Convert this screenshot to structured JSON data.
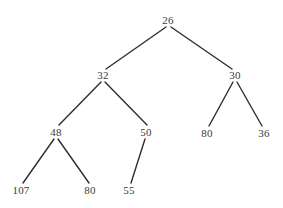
{
  "figure": {
    "kind": "binary-tree-diagram",
    "width": 283,
    "height": 208,
    "background_color": "#ffffff",
    "edge_color": "#2e2e2e",
    "label_color": "#3a3a3a"
  },
  "tree": {
    "root_value": "26",
    "nodes": [
      {
        "id": "n0",
        "label": "26",
        "x": 168,
        "y": 20,
        "level": 0,
        "parent": null
      },
      {
        "id": "n1",
        "label": "32",
        "x": 103,
        "y": 75,
        "level": 1,
        "parent": "n0"
      },
      {
        "id": "n2",
        "label": "30",
        "x": 235,
        "y": 75,
        "level": 1,
        "parent": "n0"
      },
      {
        "id": "n3",
        "label": "48",
        "x": 56,
        "y": 132,
        "level": 2,
        "parent": "n1"
      },
      {
        "id": "n4",
        "label": "50",
        "x": 146,
        "y": 132,
        "level": 2,
        "parent": "n1"
      },
      {
        "id": "n5",
        "label": "80",
        "x": 207,
        "y": 133,
        "level": 2,
        "parent": "n2"
      },
      {
        "id": "n6",
        "label": "36",
        "x": 264,
        "y": 133,
        "level": 2,
        "parent": "n2"
      },
      {
        "id": "n7",
        "label": "107",
        "x": 21,
        "y": 190,
        "level": 3,
        "parent": "n3"
      },
      {
        "id": "n8",
        "label": "80",
        "x": 90,
        "y": 190,
        "level": 3,
        "parent": "n3"
      },
      {
        "id": "n9",
        "label": "55",
        "x": 129,
        "y": 190,
        "level": 3,
        "parent": "n4"
      }
    ],
    "edges": [
      {
        "id": "e0",
        "from": "n0",
        "to": "n1",
        "x1": 166,
        "y1": 27,
        "x2": 106,
        "y2": 69
      },
      {
        "id": "e1",
        "from": "n0",
        "to": "n2",
        "x1": 171,
        "y1": 27,
        "x2": 232,
        "y2": 69
      },
      {
        "id": "e2",
        "from": "n1",
        "to": "n3",
        "x1": 101,
        "y1": 82,
        "x2": 59,
        "y2": 125
      },
      {
        "id": "e3",
        "from": "n1",
        "to": "n4",
        "x1": 105,
        "y1": 82,
        "x2": 147,
        "y2": 125
      },
      {
        "id": "e4",
        "from": "n2",
        "to": "n5",
        "x1": 233,
        "y1": 82,
        "x2": 209,
        "y2": 126
      },
      {
        "id": "e5",
        "from": "n2",
        "to": "n6",
        "x1": 237,
        "y1": 82,
        "x2": 262,
        "y2": 126
      },
      {
        "id": "e6",
        "from": "n3",
        "to": "n7",
        "x1": 54,
        "y1": 139,
        "x2": 23,
        "y2": 183
      },
      {
        "id": "e7",
        "from": "n3",
        "to": "n8",
        "x1": 58,
        "y1": 139,
        "x2": 89,
        "y2": 183
      },
      {
        "id": "e8",
        "from": "n4",
        "to": "n9",
        "x1": 145,
        "y1": 139,
        "x2": 131,
        "y2": 183
      }
    ]
  }
}
